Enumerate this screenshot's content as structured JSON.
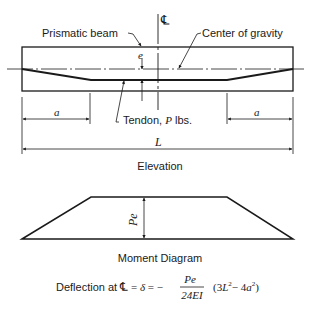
{
  "elevation": {
    "centerline_symbol": "℄",
    "labels": {
      "prismatic_beam": "Prismatic beam",
      "center_of_gravity": "Center of gravity",
      "eccentricity": "e",
      "tendon_prefix": "Tendon, ",
      "tendon_force": "P",
      "tendon_unit": " lbs.",
      "left_length": "a",
      "right_length": "a",
      "total_length": "L"
    },
    "caption": "Elevation"
  },
  "moment_diagram": {
    "value_label": "Pe",
    "caption": "Moment Diagram"
  },
  "formula": {
    "prefix": "Deflection at ",
    "centerline_symbol": "℄",
    "equals1": " = ",
    "delta": "δ",
    "equals2": " = −",
    "numerator": "Pe",
    "denominator": "24EI",
    "paren_open": "(3",
    "L": "L",
    "sq1": "2",
    "minus": "− 4",
    "a": "a",
    "sq2": "2",
    "paren_close": ")"
  }
}
